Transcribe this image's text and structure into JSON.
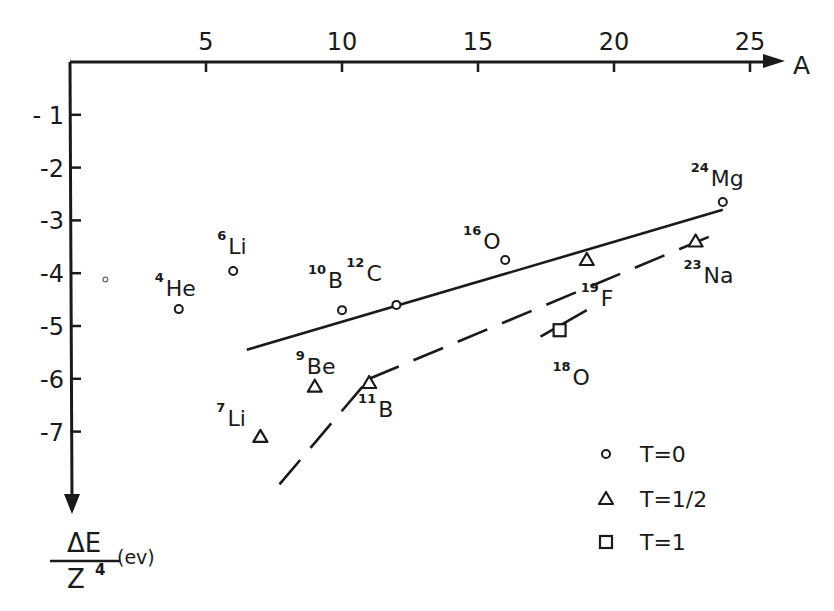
{
  "chart_data": {
    "type": "scatter",
    "title": "",
    "xlabel": "A",
    "ylabel": "ΔE / Z⁴ (ev)",
    "ylabel_parts": {
      "numerator": "ΔE",
      "denominator": "Z",
      "exponent": "4",
      "unit": "(ev)"
    },
    "xlim": [
      0,
      26
    ],
    "ylim": [
      -8.2,
      0
    ],
    "x_ticks": [
      5,
      10,
      15,
      20,
      25
    ],
    "x_tick_labels": [
      "5",
      "10",
      "15",
      "20",
      "25"
    ],
    "y_ticks": [
      -1,
      -2,
      -3,
      -4,
      -5,
      -6,
      -7
    ],
    "y_tick_labels": [
      "- 1",
      "-2",
      "-3",
      "-4",
      "-5",
      "-6",
      "-7"
    ],
    "grid": false,
    "legend_position": "lower right",
    "legend": [
      {
        "marker": "circle",
        "label": "T=0"
      },
      {
        "marker": "triangle",
        "label": "T=1/2"
      },
      {
        "marker": "square",
        "label": "T=1"
      }
    ],
    "series": [
      {
        "name": "T=0",
        "marker": "circle",
        "points": [
          {
            "nucleus": "He",
            "mass": "4",
            "x": 4,
            "y": -4.68
          },
          {
            "nucleus": "Li",
            "mass": "6",
            "x": 6,
            "y": -3.96
          },
          {
            "nucleus": "B",
            "mass": "10",
            "x": 10,
            "y": -4.7
          },
          {
            "nucleus": "C",
            "mass": "12",
            "x": 12,
            "y": -4.6
          },
          {
            "nucleus": "O",
            "mass": "16",
            "x": 16,
            "y": -3.75
          },
          {
            "nucleus": "Mg",
            "mass": "24",
            "x": 24,
            "y": -2.65
          }
        ]
      },
      {
        "name": "T=1/2",
        "marker": "triangle",
        "points": [
          {
            "nucleus": "Li",
            "mass": "7",
            "x": 7,
            "y": -7.1
          },
          {
            "nucleus": "Be",
            "mass": "9",
            "x": 9,
            "y": -6.15
          },
          {
            "nucleus": "B",
            "mass": "11",
            "x": 11,
            "y": -6.08
          },
          {
            "nucleus": "F",
            "mass": "19",
            "x": 19,
            "y": -3.75
          },
          {
            "nucleus": "Na",
            "mass": "23",
            "x": 23,
            "y": -3.4
          }
        ]
      },
      {
        "name": "T=1",
        "marker": "square",
        "points": [
          {
            "nucleus": "O",
            "mass": "18",
            "x": 18,
            "y": -5.08
          }
        ]
      }
    ],
    "fit_lines": [
      {
        "name": "T=0 trend",
        "style": "solid",
        "from": [
          6.5,
          -5.45
        ],
        "to": [
          24,
          -2.8
        ]
      },
      {
        "name": "T=1/2 trend lower",
        "style": "dashed",
        "from": [
          7.7,
          -8.0
        ],
        "to": [
          11,
          -6.0
        ]
      },
      {
        "name": "T=1/2 trend upper",
        "style": "dashed",
        "from": [
          11,
          -6.0
        ],
        "to": [
          24,
          -3.2
        ]
      },
      {
        "name": "T=1 segment",
        "style": "solid",
        "from": [
          17.3,
          -5.2
        ],
        "to": [
          19,
          -4.7
        ]
      }
    ],
    "extra_marks": [
      {
        "marker": "small-circle",
        "x": 1.3,
        "y": -4.12
      }
    ]
  },
  "labels": {
    "x_axis": "A",
    "ev": "(ev)",
    "delta_e": "ΔE",
    "z": "Z",
    "z_exp": "4"
  }
}
